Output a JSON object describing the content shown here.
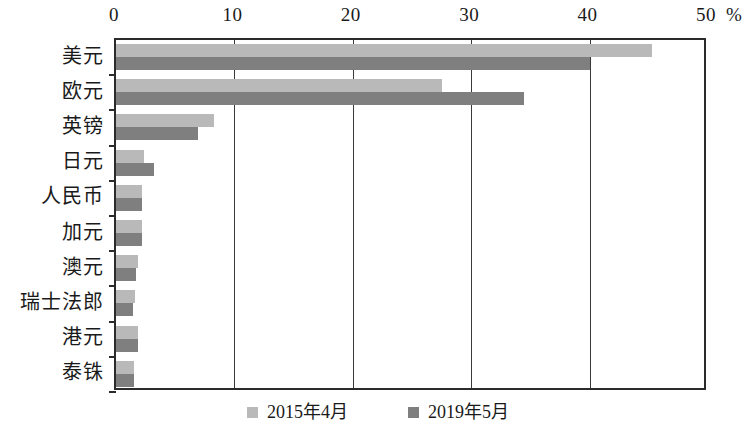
{
  "chart_data": {
    "type": "bar",
    "orientation": "horizontal",
    "title": "",
    "subtitle": "",
    "xlabel": "%",
    "ylabel": "",
    "xlim": [
      0,
      50
    ],
    "xticks": [
      0,
      10,
      20,
      30,
      40,
      50
    ],
    "xtick_labels": [
      "0",
      "10",
      "20",
      "30",
      "40",
      "50"
    ],
    "unit_label": "%",
    "grid": true,
    "grid_axis": "x",
    "legend_position": "bottom",
    "categories": [
      "美元",
      "欧元",
      "英镑",
      "日元",
      "人民币",
      "加元",
      "澳元",
      "瑞士法郎",
      "港元",
      "泰铢"
    ],
    "series": [
      {
        "name": "2015年4月",
        "color": "#b9b9b9",
        "values": [
          45.3,
          27.5,
          8.3,
          2.4,
          2.2,
          2.2,
          1.9,
          1.6,
          1.9,
          1.5
        ]
      },
      {
        "name": "2019年5月",
        "color": "#7f7f7f",
        "values": [
          40.0,
          34.5,
          6.9,
          3.2,
          2.2,
          2.2,
          1.7,
          1.4,
          1.9,
          1.5
        ]
      }
    ]
  },
  "axes": {
    "x_unit": "%"
  },
  "legend": {
    "items": [
      {
        "label": "2015年4月",
        "color": "#b9b9b9"
      },
      {
        "label": "2019年5月",
        "color": "#7f7f7f"
      }
    ]
  },
  "colors": {
    "series_2015": "#b9b9b9",
    "series_2019": "#7f7f7f",
    "axis": "#2b2b2b",
    "gridline": "#3a3a3a",
    "background": "#ffffff"
  }
}
